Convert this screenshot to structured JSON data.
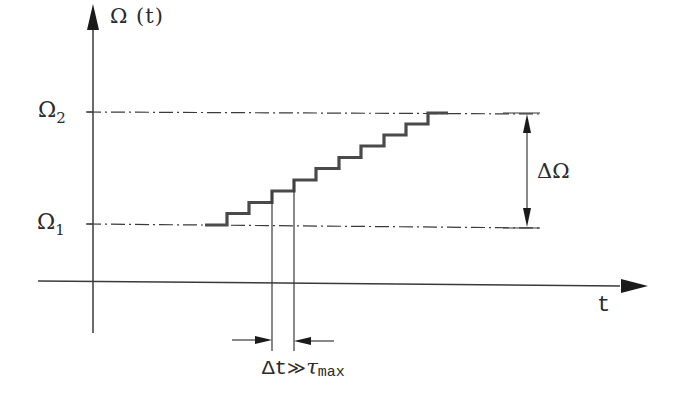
{
  "diagram": {
    "y_axis_label": "Ω (t)",
    "x_axis_label": "t",
    "levels": [
      {
        "symbol": "Ω",
        "subscript": "1",
        "y": 225
      },
      {
        "symbol": "Ω",
        "subscript": "2",
        "y": 113
      }
    ],
    "delta_omega_label": "ΔΩ",
    "delta_t_label": {
      "main": "Δt",
      "relation": "≫",
      "tau": "τ",
      "subscript": "max"
    },
    "staircase": {
      "start_x": 205,
      "step_width": 22.3,
      "step_height": 11.2,
      "steps": 10,
      "end_x": 448,
      "highlighted_step_index": 3
    },
    "colors": {
      "line": "#2a2a2a",
      "staircase": "#4a4a4a",
      "background": "#ffffff"
    }
  }
}
